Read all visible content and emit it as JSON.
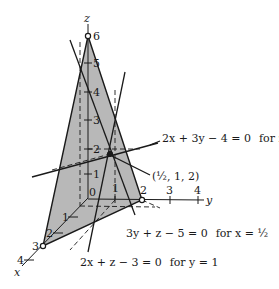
{
  "figure": {
    "colors": {
      "region_fill": "#b8b8b8",
      "line": "#1a1a1a",
      "background": "#ffffff"
    },
    "axes": {
      "z_label": "z",
      "y_label": "y",
      "x_label": "x",
      "z_ticks": [
        "1",
        "2",
        "3",
        "4",
        "5",
        "6"
      ],
      "y_ticks": [
        "1",
        "2",
        "3",
        "4"
      ],
      "x_ticks": [
        "1",
        "2",
        "3",
        "4"
      ],
      "origin_label": "0"
    },
    "point": {
      "label": "(½, 1, 2)"
    },
    "equations": [
      {
        "expr": "2x + 3y − 4 = 0",
        "condition": "for z = 2"
      },
      {
        "expr": "3y + z − 5 = 0",
        "condition": "for x = ½"
      },
      {
        "expr": "2x + z − 3 = 0",
        "condition": "for y = 1"
      }
    ]
  }
}
